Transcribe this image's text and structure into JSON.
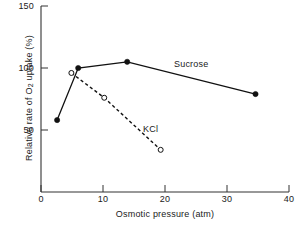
{
  "chart_data": {
    "type": "line",
    "title": "",
    "xlabel": "Osmotic pressure (atm)",
    "ylabel_parts": {
      "pre": "Relative rate of O",
      "sub": "2",
      "post": " uptake (%)"
    },
    "ylabel": "Relative rate of O2 uptake (%)",
    "xlim": [
      0,
      40
    ],
    "ylim": [
      0,
      150
    ],
    "xticks": [
      0,
      10,
      20,
      30,
      40
    ],
    "yticks": [
      50,
      100,
      150
    ],
    "xtick_labels": [
      "0",
      "10",
      "20",
      "30",
      "40"
    ],
    "ytick_labels": [
      "50",
      "100",
      "150"
    ],
    "grid": false,
    "legend": "inline-annotations",
    "series": [
      {
        "name": "Sucrose",
        "marker": "filled-circle",
        "linestyle": "solid",
        "color": "#111111",
        "x": [
          2.6,
          6.0,
          13.9,
          34.6
        ],
        "y": [
          58,
          100,
          105,
          79
        ]
      },
      {
        "name": "KCl",
        "marker": "open-circle",
        "linestyle": "dashed",
        "color": "#111111",
        "x": [
          4.9,
          10.2,
          19.3
        ],
        "y": [
          96,
          76,
          34
        ]
      }
    ],
    "annotations": [
      {
        "text": "Sucrose",
        "x": 21.6,
        "y": 88
      },
      {
        "text": "KCl",
        "x": 16.5,
        "y": 40
      }
    ]
  }
}
